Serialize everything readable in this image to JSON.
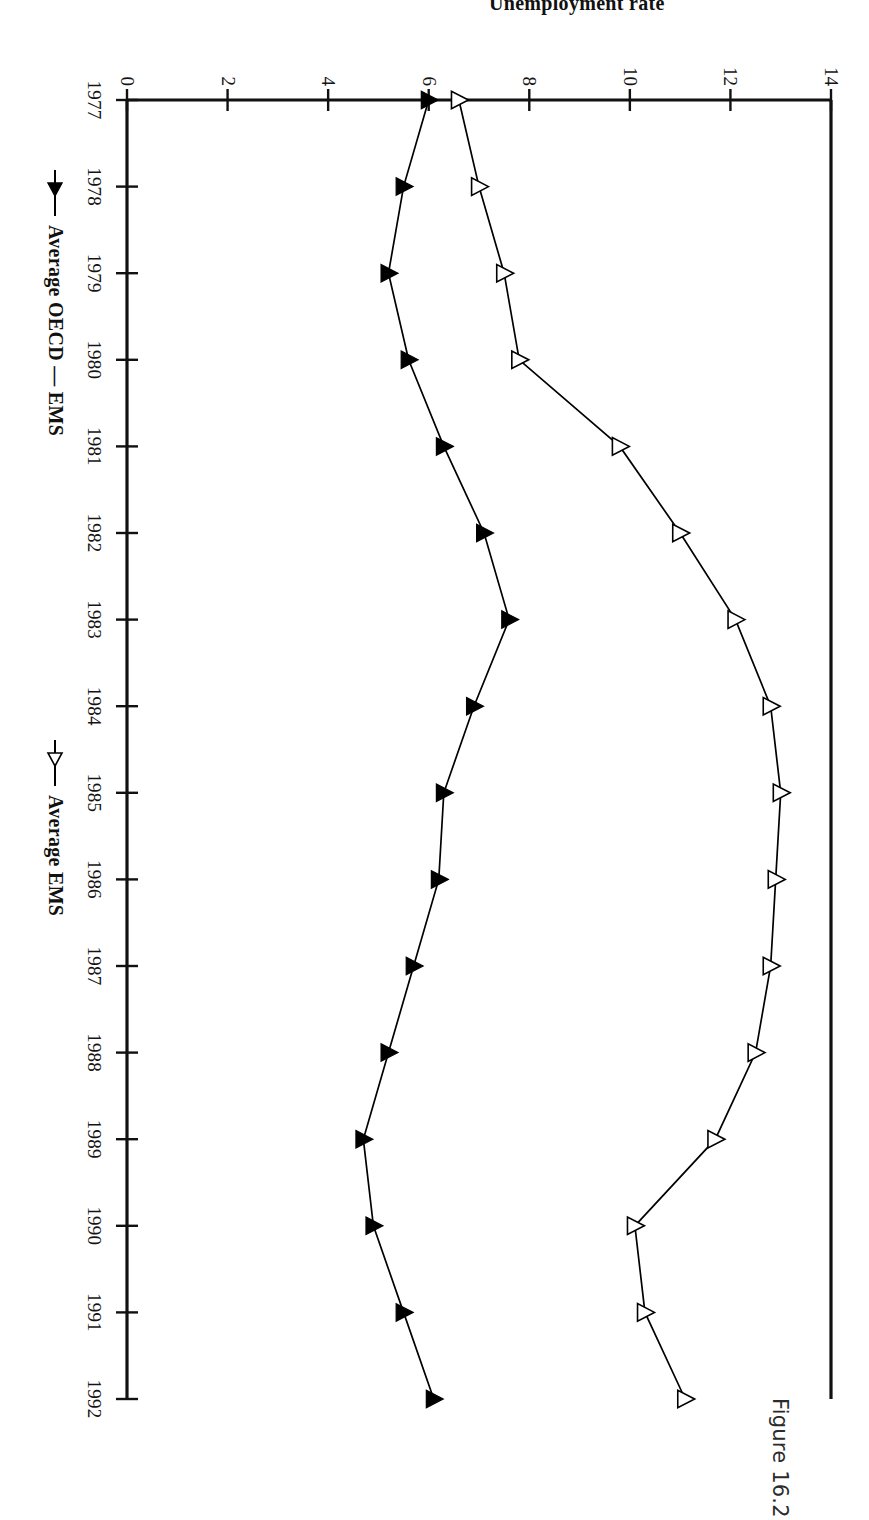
{
  "caption": "Figure 16.2",
  "axes": {
    "y_axis_title": "Unemployment rate",
    "y_ticks": [
      "0",
      "2",
      "4",
      "6",
      "8",
      "10",
      "12",
      "14"
    ],
    "x_ticks": [
      "1977",
      "1978",
      "1979",
      "1980",
      "1981",
      "1982",
      "1983",
      "1984",
      "1985",
      "1986",
      "1987",
      "1988",
      "1989",
      "1990",
      "1991",
      "1992"
    ]
  },
  "legend": {
    "entries": [
      {
        "label": "Average OECD — EMS",
        "marker": "filled-triangle-marker",
        "color": "#000000"
      },
      {
        "label": "Average EMS",
        "marker": "open-triangle-marker",
        "color": "#000000"
      }
    ]
  },
  "chart_data": {
    "type": "line",
    "title": "",
    "xlabel": "",
    "ylabel": "Unemployment rate",
    "x": [
      1977,
      1978,
      1979,
      1980,
      1981,
      1982,
      1983,
      1984,
      1985,
      1986,
      1987,
      1988,
      1989,
      1990,
      1991,
      1992
    ],
    "categories": [
      "1977",
      "1978",
      "1979",
      "1980",
      "1981",
      "1982",
      "1983",
      "1984",
      "1985",
      "1986",
      "1987",
      "1988",
      "1989",
      "1990",
      "1991",
      "1992"
    ],
    "series": [
      {
        "name": "Average OECD — EMS",
        "marker": "filled-triangle",
        "color": "#000000",
        "values": [
          6.0,
          5.5,
          5.2,
          5.6,
          6.3,
          7.1,
          7.6,
          6.9,
          6.3,
          6.2,
          5.7,
          5.2,
          4.7,
          4.9,
          5.5,
          6.1
        ]
      },
      {
        "name": "Average EMS",
        "marker": "open-triangle",
        "color": "#000000",
        "values": [
          6.6,
          7.0,
          7.5,
          7.8,
          9.8,
          11.0,
          12.1,
          12.8,
          13.0,
          12.9,
          12.8,
          12.5,
          11.7,
          10.1,
          10.3,
          11.1
        ]
      }
    ],
    "xlim": [
      1977,
      1992
    ],
    "ylim": [
      0,
      14
    ],
    "ytick_step": 2,
    "grid": false,
    "legend_position": "bottom"
  }
}
